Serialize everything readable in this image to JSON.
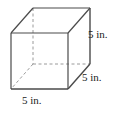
{
  "figure": {
    "name": "cube-diagram",
    "shape": "cube",
    "projection": "oblique",
    "unit": "in.",
    "edge_length": 5,
    "line_color": "#4a4a4a",
    "hidden_line_color": "#9a9a9a",
    "background_color": "#ffffff",
    "labels": {
      "height": "5 in.",
      "depth": "5 in.",
      "width": "5 in."
    },
    "vertices": {
      "front_top_left": [
        11,
        33
      ],
      "front_top_right": [
        68,
        33
      ],
      "front_bottom_right": [
        68,
        89
      ],
      "front_bottom_left": [
        11,
        89
      ],
      "back_top_left": [
        33,
        8
      ],
      "back_top_right": [
        90,
        8
      ],
      "back_bottom_right": [
        90,
        64
      ],
      "back_bottom_left_hidden": [
        33,
        64
      ]
    },
    "edges": {
      "visible": [
        "front_top_left-front_top_right",
        "front_top_right-front_bottom_right",
        "front_bottom_right-front_bottom_left",
        "front_bottom_left-front_top_left",
        "back_top_left-back_top_right",
        "back_top_right-back_bottom_right",
        "front_top_left-back_top_left",
        "front_top_right-back_top_right",
        "front_bottom_right-back_bottom_right"
      ],
      "hidden": [
        "back_top_left-back_bottom_left_hidden",
        "back_bottom_left_hidden-back_bottom_right",
        "back_bottom_left_hidden-front_bottom_left"
      ]
    }
  }
}
